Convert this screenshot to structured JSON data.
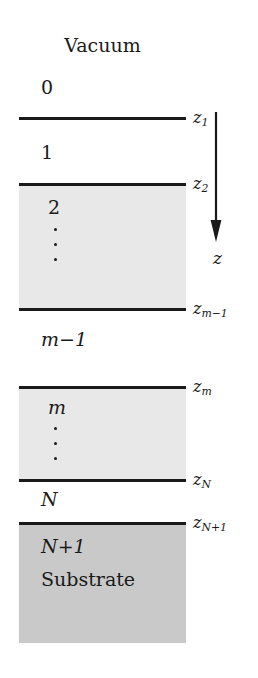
{
  "figure": {
    "kind": "multilayer-stack-schematic",
    "top_medium_label": "Vacuum",
    "substrate_label": "Substrate",
    "axis_label": "z",
    "axis_direction": "downward",
    "colors": {
      "background": "#ffffff",
      "line": "#1a1a1a",
      "layer_fill_light": "#e8e8e8",
      "layer_fill_substrate": "#c9c9c9"
    }
  },
  "layers": [
    {
      "index": "0",
      "name": "vacuum-layer",
      "filled": false
    },
    {
      "index": "1",
      "name": "layer-1",
      "filled": false
    },
    {
      "index": "2",
      "name": "layer-2",
      "filled": true
    },
    {
      "index": "m-1",
      "name": "layer-m-minus-1",
      "filled": false
    },
    {
      "index": "m",
      "name": "layer-m",
      "filled": true
    },
    {
      "index": "N",
      "name": "layer-N",
      "filled": false
    },
    {
      "index": "N+1",
      "name": "layer-N-plus-1",
      "filled": true
    }
  ],
  "interfaces": [
    {
      "id": "z1",
      "base": "z",
      "sub": "1"
    },
    {
      "id": "z2",
      "base": "z",
      "sub": "2"
    },
    {
      "id": "zm1",
      "base": "z",
      "sub": "m−1"
    },
    {
      "id": "zm",
      "base": "z",
      "sub": "m"
    },
    {
      "id": "zN",
      "base": "z",
      "sub": "N"
    },
    {
      "id": "zN1",
      "base": "z",
      "sub": "N+1"
    }
  ],
  "labels": {
    "vacuum": "Vacuum",
    "l0": "0",
    "l1": "1",
    "l2": "2",
    "lm1": "m−1",
    "lm": "m",
    "lN": "N",
    "lN1": "N+1",
    "substrate": "Substrate",
    "z_axis": "z",
    "z1_base": "z",
    "z1_sub": "1",
    "z2_base": "z",
    "z2_sub": "2",
    "zm1_base": "z",
    "zm1_sub": "m−1",
    "zm_base": "z",
    "zm_sub": "m",
    "zN_base": "z",
    "zN_sub": "N",
    "zN1_base": "z",
    "zN1_sub": "N+1"
  }
}
